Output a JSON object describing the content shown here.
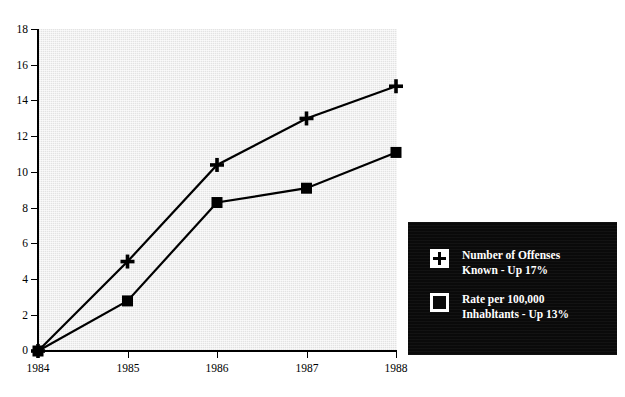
{
  "chart_data": {
    "type": "line",
    "title": "",
    "xlabel": "",
    "ylabel": "",
    "categories": [
      "1984",
      "1985",
      "1986",
      "1987",
      "1988"
    ],
    "x_tick_labels": [
      "1984",
      "1985",
      "1986",
      "1987",
      "1988"
    ],
    "y_tick_labels": [
      "0",
      "2",
      "4",
      "6",
      "8",
      "10",
      "12",
      "14",
      "16",
      "18"
    ],
    "y_ticks": [
      0,
      2,
      4,
      6,
      8,
      10,
      12,
      14,
      16,
      18
    ],
    "ylim": [
      0,
      18
    ],
    "xlim": [
      "1984",
      "1988"
    ],
    "grid": false,
    "legend_position": "bottom-right",
    "plot_background": "#e3e3e3",
    "series": [
      {
        "name": "Number of Offenses Known - Up 17%",
        "marker": "plus",
        "color": "#000000",
        "values": [
          0.0,
          5.0,
          10.4,
          13.0,
          14.8
        ]
      },
      {
        "name": "Rate per 100,000 Inhabitants - Up 13%",
        "marker": "square",
        "color": "#000000",
        "values": [
          0.0,
          2.8,
          8.3,
          9.1,
          11.1
        ]
      }
    ]
  },
  "legend": {
    "background": "#0a0a0a",
    "text_color": "#ffffff",
    "entries": [
      {
        "marker": "plus-icon",
        "line1": "Number of Offenses",
        "line2": "Known - Up 17%"
      },
      {
        "marker": "open-square-icon",
        "line1": "Rate per 100,000",
        "line2": "Inhabltants - Up 13%"
      }
    ]
  },
  "axes": {
    "y_labels": [
      "18",
      "16",
      "14",
      "12",
      "10",
      "8",
      "6",
      "4",
      "2",
      "0"
    ],
    "x_labels": [
      "1984",
      "1985",
      "1986",
      "1987",
      "1988"
    ]
  }
}
